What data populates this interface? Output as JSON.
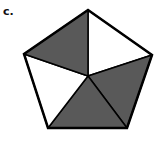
{
  "problem": {
    "label": "c.",
    "shape": "pentagon",
    "total_parts": 5,
    "shaded_parts": 3
  },
  "colors": {
    "shaded": "#595959",
    "unshaded": "#ffffff",
    "stroke": "#000000"
  },
  "geometry": {
    "center": [
      88,
      76
    ],
    "vertices": [
      [
        88,
        10
      ],
      [
        152,
        55
      ],
      [
        127,
        128
      ],
      [
        48,
        128
      ],
      [
        24,
        54
      ]
    ],
    "sectors": [
      {
        "name": "top-right",
        "shaded": false
      },
      {
        "name": "right",
        "shaded": true
      },
      {
        "name": "bottom",
        "shaded": true
      },
      {
        "name": "left",
        "shaded": false
      },
      {
        "name": "top-left",
        "shaded": true
      }
    ]
  }
}
